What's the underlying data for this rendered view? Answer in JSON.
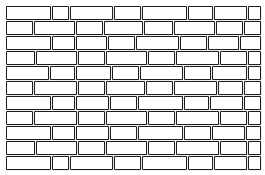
{
  "figure": {
    "type": "line-drawing",
    "width": 265,
    "height": 175,
    "background_color": "#ffffff",
    "stroke_color": "#1d1d1d",
    "shadow_color": "#a9a9a9",
    "brick_fill": "#ffffff",
    "pattern": "running bond",
    "row_count": 11,
    "row_height": 13,
    "row_gap": 2,
    "first_row_top": 6,
    "left_margin": 6,
    "right_margin": 6,
    "brick_gap": 2
  },
  "rows": [
    {
      "index": 0,
      "top": 6,
      "label": "row-1",
      "bricks": [
        {
          "x": 6,
          "w": 44
        },
        {
          "x": 52,
          "w": 16
        },
        {
          "x": 70,
          "w": 42
        },
        {
          "x": 114,
          "w": 26
        },
        {
          "x": 142,
          "w": 44
        },
        {
          "x": 188,
          "w": 24
        },
        {
          "x": 214,
          "w": 32
        },
        {
          "x": 248,
          "w": 12
        }
      ]
    },
    {
      "index": 1,
      "top": 21,
      "label": "row-2",
      "bricks": [
        {
          "x": 6,
          "w": 26
        },
        {
          "x": 34,
          "w": 40
        },
        {
          "x": 76,
          "w": 26
        },
        {
          "x": 104,
          "w": 38
        },
        {
          "x": 144,
          "w": 28
        },
        {
          "x": 174,
          "w": 40
        },
        {
          "x": 216,
          "w": 26
        },
        {
          "x": 244,
          "w": 16
        }
      ]
    },
    {
      "index": 2,
      "top": 36,
      "label": "row-3",
      "bricks": [
        {
          "x": 6,
          "w": 44
        },
        {
          "x": 52,
          "w": 22
        },
        {
          "x": 76,
          "w": 30
        },
        {
          "x": 108,
          "w": 26
        },
        {
          "x": 136,
          "w": 42
        },
        {
          "x": 180,
          "w": 26
        },
        {
          "x": 208,
          "w": 30
        },
        {
          "x": 240,
          "w": 20
        }
      ]
    },
    {
      "index": 3,
      "top": 51,
      "label": "row-4",
      "bricks": [
        {
          "x": 6,
          "w": 28
        },
        {
          "x": 36,
          "w": 40
        },
        {
          "x": 78,
          "w": 26
        },
        {
          "x": 106,
          "w": 40
        },
        {
          "x": 148,
          "w": 26
        },
        {
          "x": 176,
          "w": 42
        },
        {
          "x": 220,
          "w": 26
        },
        {
          "x": 248,
          "w": 12
        }
      ]
    },
    {
      "index": 4,
      "top": 66,
      "label": "row-5",
      "bricks": [
        {
          "x": 6,
          "w": 42
        },
        {
          "x": 50,
          "w": 24
        },
        {
          "x": 76,
          "w": 34
        },
        {
          "x": 112,
          "w": 26
        },
        {
          "x": 140,
          "w": 42
        },
        {
          "x": 184,
          "w": 26
        },
        {
          "x": 212,
          "w": 34
        },
        {
          "x": 248,
          "w": 12
        }
      ]
    },
    {
      "index": 5,
      "top": 81,
      "label": "row-6",
      "bricks": [
        {
          "x": 6,
          "w": 26
        },
        {
          "x": 34,
          "w": 42
        },
        {
          "x": 78,
          "w": 26
        },
        {
          "x": 106,
          "w": 38
        },
        {
          "x": 146,
          "w": 26
        },
        {
          "x": 174,
          "w": 42
        },
        {
          "x": 218,
          "w": 24
        },
        {
          "x": 244,
          "w": 16
        }
      ]
    },
    {
      "index": 6,
      "top": 96,
      "label": "row-7",
      "bricks": [
        {
          "x": 6,
          "w": 44
        },
        {
          "x": 52,
          "w": 22
        },
        {
          "x": 76,
          "w": 32
        },
        {
          "x": 110,
          "w": 26
        },
        {
          "x": 138,
          "w": 44
        },
        {
          "x": 184,
          "w": 24
        },
        {
          "x": 210,
          "w": 32
        },
        {
          "x": 244,
          "w": 16
        }
      ]
    },
    {
      "index": 7,
      "top": 111,
      "label": "row-8",
      "bricks": [
        {
          "x": 6,
          "w": 26
        },
        {
          "x": 34,
          "w": 42
        },
        {
          "x": 78,
          "w": 26
        },
        {
          "x": 106,
          "w": 40
        },
        {
          "x": 148,
          "w": 26
        },
        {
          "x": 176,
          "w": 42
        },
        {
          "x": 220,
          "w": 26
        },
        {
          "x": 248,
          "w": 12
        }
      ]
    },
    {
      "index": 8,
      "top": 126,
      "label": "row-9",
      "bricks": [
        {
          "x": 6,
          "w": 44
        },
        {
          "x": 52,
          "w": 22
        },
        {
          "x": 76,
          "w": 32
        },
        {
          "x": 110,
          "w": 26
        },
        {
          "x": 138,
          "w": 44
        },
        {
          "x": 184,
          "w": 26
        },
        {
          "x": 212,
          "w": 32
        },
        {
          "x": 246,
          "w": 14
        }
      ]
    },
    {
      "index": 9,
      "top": 141,
      "label": "row-10",
      "bricks": [
        {
          "x": 6,
          "w": 28
        },
        {
          "x": 36,
          "w": 40
        },
        {
          "x": 78,
          "w": 26
        },
        {
          "x": 106,
          "w": 40
        },
        {
          "x": 148,
          "w": 26
        },
        {
          "x": 176,
          "w": 42
        },
        {
          "x": 220,
          "w": 26
        },
        {
          "x": 248,
          "w": 12
        }
      ]
    },
    {
      "index": 10,
      "top": 156,
      "label": "row-11",
      "bricks": [
        {
          "x": 6,
          "w": 44
        },
        {
          "x": 52,
          "w": 16
        },
        {
          "x": 70,
          "w": 42
        },
        {
          "x": 114,
          "w": 26
        },
        {
          "x": 142,
          "w": 44
        },
        {
          "x": 188,
          "w": 24
        },
        {
          "x": 214,
          "w": 32
        },
        {
          "x": 248,
          "w": 12
        }
      ]
    }
  ]
}
